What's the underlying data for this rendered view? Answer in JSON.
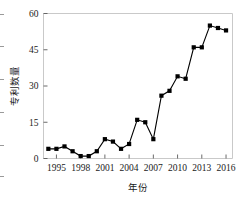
{
  "chart_data": {
    "type": "line",
    "title": "",
    "subtitle": "",
    "xlabel": "年份",
    "ylabel": "专利数量",
    "x": [
      1994,
      1995,
      1996,
      1997,
      1998,
      1999,
      2000,
      2001,
      2002,
      2003,
      2004,
      2005,
      2006,
      2007,
      2008,
      2009,
      2010,
      2011,
      2012,
      2013,
      2014,
      2015,
      2016
    ],
    "values": [
      4,
      4,
      5,
      3,
      1,
      1,
      3,
      8,
      7,
      4,
      6,
      16,
      15,
      8,
      26,
      28,
      34,
      33,
      46,
      46,
      55,
      54,
      53
    ],
    "series": [
      {
        "name": "专利数量",
        "values": [
          4,
          4,
          5,
          3,
          1,
          1,
          3,
          8,
          7,
          4,
          6,
          16,
          15,
          8,
          26,
          28,
          34,
          33,
          46,
          46,
          55,
          54,
          53
        ]
      }
    ],
    "xlim": [
      1993.4,
      2016.8
    ],
    "ylim": [
      0,
      60
    ],
    "xticks": [
      1995,
      1998,
      2001,
      2004,
      2007,
      2010,
      2013,
      2016
    ],
    "xtick_labels": [
      "1995",
      "1998",
      "2001",
      "2004",
      "2007",
      "2010",
      "2013",
      "2016"
    ],
    "yticks": [
      0,
      15,
      30,
      45,
      60
    ],
    "ytick_labels": [
      "0",
      "15",
      "30",
      "45",
      "60"
    ],
    "grid": false,
    "legend": null,
    "legend_position": "none",
    "marker": "square",
    "line_color": "#000000",
    "marker_color": "#000000",
    "axis_color": "#c9c9c9",
    "background_color": "#ffffff",
    "annotations": []
  },
  "axis": {
    "ylabel_text": "专利数量",
    "xlabel_text": "年份"
  }
}
